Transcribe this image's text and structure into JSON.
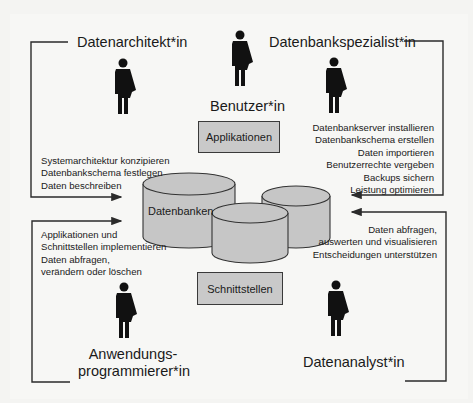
{
  "roles": {
    "data_architect": {
      "title": "Datenarchitekt*in",
      "tasks": [
        "Systemarchitektur konzipieren",
        "Datenbankschema festlegen",
        "Daten beschreiben"
      ]
    },
    "user": {
      "title": "Benutzer*in"
    },
    "db_specialist": {
      "title": "Datenbankspezialist*in",
      "tasks": [
        "Datenbankserver installieren",
        "Datenbankschema erstellen",
        "Daten importieren",
        "Benutzerrechte vergeben",
        "Backups sichern",
        "Leistung optimieren"
      ]
    },
    "app_developer": {
      "title_line1": "Anwendungs-",
      "title_line2": "programmierer*in",
      "tasks": [
        "Applikationen und",
        "Schnittstellen implementieren",
        "Daten abfragen,",
        "verändern oder löschen"
      ]
    },
    "data_analyst": {
      "title": "Datenanalyst*in",
      "tasks": [
        "Daten abfragen,",
        "auswerten und visualisieren",
        "Entscheidungen unterstützen"
      ]
    }
  },
  "components": {
    "applications": "Applikationen",
    "interfaces": "Schnittstellen",
    "databases": "Datenbanken"
  },
  "icons": {
    "person": "person-icon",
    "database": "database-cylinder-icon"
  },
  "colors": {
    "line": "#2b2b2b",
    "box_fill": "#c9c9c9",
    "cylinder_fill": "#c6c6c6",
    "background": "#f7f7f5"
  }
}
